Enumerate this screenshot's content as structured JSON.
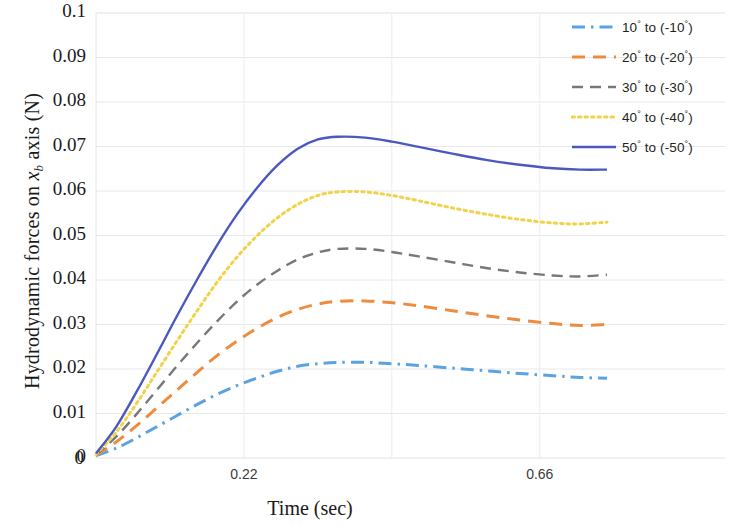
{
  "chart_data": {
    "type": "line",
    "title": "",
    "xlabel": "Time  (sec)",
    "ylabel_prefix": "Hydrodynamic  forces  on  ",
    "ylabel_var": "x",
    "ylabel_sub": "b",
    "ylabel_suffix": " axis (N)",
    "ylabel_full": "Hydrodynamic forces on x_b axis (N)",
    "xlim": [
      0,
      0.76
    ],
    "ylim": [
      0,
      0.1
    ],
    "grid": true,
    "legend_position": "top-right",
    "xticks": [
      {
        "value": 0,
        "label": "0"
      },
      {
        "value": 0.22,
        "label": "0.22"
      },
      {
        "value": 0.66,
        "label": "0.66"
      }
    ],
    "yticks": [
      {
        "value": 0,
        "label": "0"
      },
      {
        "value": 0.01,
        "label": "0.01"
      },
      {
        "value": 0.02,
        "label": "0.02"
      },
      {
        "value": 0.03,
        "label": "0.03"
      },
      {
        "value": 0.04,
        "label": "0.04"
      },
      {
        "value": 0.05,
        "label": "0.05"
      },
      {
        "value": 0.06,
        "label": "0.06"
      },
      {
        "value": 0.07,
        "label": "0.07"
      },
      {
        "value": 0.08,
        "label": "0.08"
      },
      {
        "value": 0.09,
        "label": "0.09"
      },
      {
        "value": 0.1,
        "label": "0.1"
      }
    ],
    "series": [
      {
        "name": "10° to (-10°)",
        "label_num1": "10",
        "label_num2": "-10",
        "color": "#5BA3E0",
        "style": "dashdot",
        "x": [
          0,
          0.03,
          0.06,
          0.09,
          0.12,
          0.15,
          0.18,
          0.21,
          0.24,
          0.27,
          0.3,
          0.33,
          0.36,
          0.4,
          0.44,
          0.48,
          0.53,
          0.58,
          0.63,
          0.68,
          0.72,
          0.76
        ],
        "values": [
          0.0005,
          0.0022,
          0.0045,
          0.007,
          0.0095,
          0.012,
          0.0143,
          0.0163,
          0.018,
          0.0195,
          0.0206,
          0.0212,
          0.0215,
          0.0215,
          0.0212,
          0.0208,
          0.0202,
          0.0196,
          0.019,
          0.0185,
          0.0181,
          0.0179
        ]
      },
      {
        "name": "20° to (-20°)",
        "label_num1": "20",
        "label_num2": "-20",
        "color": "#ED8B3F",
        "style": "dashed",
        "x": [
          0,
          0.03,
          0.06,
          0.09,
          0.12,
          0.15,
          0.18,
          0.21,
          0.24,
          0.27,
          0.3,
          0.33,
          0.36,
          0.4,
          0.44,
          0.48,
          0.53,
          0.58,
          0.63,
          0.68,
          0.72,
          0.76
        ],
        "values": [
          0.0006,
          0.0036,
          0.0072,
          0.0112,
          0.0152,
          0.0192,
          0.023,
          0.0263,
          0.0292,
          0.0316,
          0.0334,
          0.0346,
          0.0352,
          0.0353,
          0.0349,
          0.0342,
          0.0331,
          0.032,
          0.031,
          0.0302,
          0.0298,
          0.03
        ]
      },
      {
        "name": "30° to (-30°)",
        "label_num1": "30",
        "label_num2": "-30",
        "color": "#787878",
        "style": "dashed-long",
        "x": [
          0,
          0.03,
          0.06,
          0.09,
          0.12,
          0.15,
          0.18,
          0.21,
          0.24,
          0.27,
          0.3,
          0.33,
          0.36,
          0.4,
          0.44,
          0.48,
          0.53,
          0.58,
          0.63,
          0.68,
          0.72,
          0.76
        ],
        "values": [
          0.0007,
          0.0048,
          0.0098,
          0.0152,
          0.0206,
          0.0258,
          0.0307,
          0.0352,
          0.039,
          0.0421,
          0.0446,
          0.0462,
          0.047,
          0.047,
          0.0463,
          0.0453,
          0.044,
          0.0427,
          0.0417,
          0.041,
          0.0408,
          0.0412
        ]
      },
      {
        "name": "40° to (-40°)",
        "label_num1": "40",
        "label_num2": "-40",
        "color": "#F0D24B",
        "style": "dotted",
        "x": [
          0,
          0.03,
          0.06,
          0.09,
          0.12,
          0.15,
          0.18,
          0.21,
          0.24,
          0.27,
          0.3,
          0.33,
          0.36,
          0.4,
          0.44,
          0.48,
          0.53,
          0.58,
          0.63,
          0.68,
          0.72,
          0.76
        ],
        "values": [
          0.0008,
          0.0058,
          0.0122,
          0.0192,
          0.0262,
          0.033,
          0.0395,
          0.0452,
          0.05,
          0.054,
          0.057,
          0.059,
          0.0598,
          0.0598,
          0.059,
          0.0578,
          0.0562,
          0.0548,
          0.0536,
          0.0528,
          0.0526,
          0.053
        ]
      },
      {
        "name": "50° to (-50°)",
        "label_num1": "50",
        "label_num2": "-50",
        "color": "#4B58C0",
        "style": "solid",
        "x": [
          0,
          0.03,
          0.06,
          0.09,
          0.12,
          0.15,
          0.18,
          0.21,
          0.24,
          0.27,
          0.3,
          0.33,
          0.36,
          0.4,
          0.44,
          0.48,
          0.53,
          0.58,
          0.63,
          0.68,
          0.72,
          0.76
        ],
        "values": [
          0.001,
          0.007,
          0.0148,
          0.0232,
          0.0318,
          0.04,
          0.0478,
          0.0548,
          0.0608,
          0.0658,
          0.0695,
          0.0716,
          0.0722,
          0.072,
          0.0711,
          0.0699,
          0.0684,
          0.067,
          0.0659,
          0.0651,
          0.0648,
          0.0648
        ]
      }
    ]
  }
}
